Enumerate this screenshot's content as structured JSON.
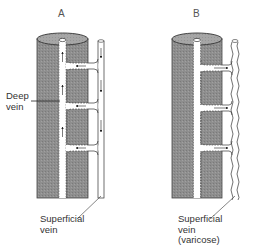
{
  "figure": {
    "panels": [
      {
        "id": "A",
        "letter": "A",
        "labels": {
          "deep_vein": "Deep\nvein",
          "superficial_vein": "Superficial\nvein"
        },
        "superficial_vein_style": "straight",
        "flow_arrows": "superficial-to-deep (normal valves)"
      },
      {
        "id": "B",
        "letter": "B",
        "labels": {
          "superficial_vein": "Superficial\nvein\n(varicose)"
        },
        "superficial_vein_style": "wavy",
        "flow_arrows": "deep-to-superficial (incompetent valves)"
      }
    ],
    "colors": {
      "limb_fill": "#8c8c8c",
      "limb_top": "#a8a8a8",
      "vein_fill": "#ffffff",
      "outline": "#3a3a3a",
      "background": "#ffffff"
    }
  }
}
